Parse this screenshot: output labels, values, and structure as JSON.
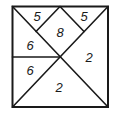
{
  "diagram": {
    "pieces": [
      {
        "id": "top-left-small-triangle",
        "label": "5",
        "x": 37,
        "y": 16
      },
      {
        "id": "top-right-small-triangle",
        "label": "5",
        "x": 84,
        "y": 16
      },
      {
        "id": "top-center-square",
        "label": "8",
        "x": 60,
        "y": 32
      },
      {
        "id": "left-upper-triangle",
        "label": "6",
        "x": 30,
        "y": 45
      },
      {
        "id": "left-lower-triangle",
        "label": "6",
        "x": 30,
        "y": 70
      },
      {
        "id": "right-large-triangle",
        "label": "2",
        "x": 89,
        "y": 57
      },
      {
        "id": "bottom-large-triangle",
        "label": "2",
        "x": 59,
        "y": 87
      }
    ]
  }
}
